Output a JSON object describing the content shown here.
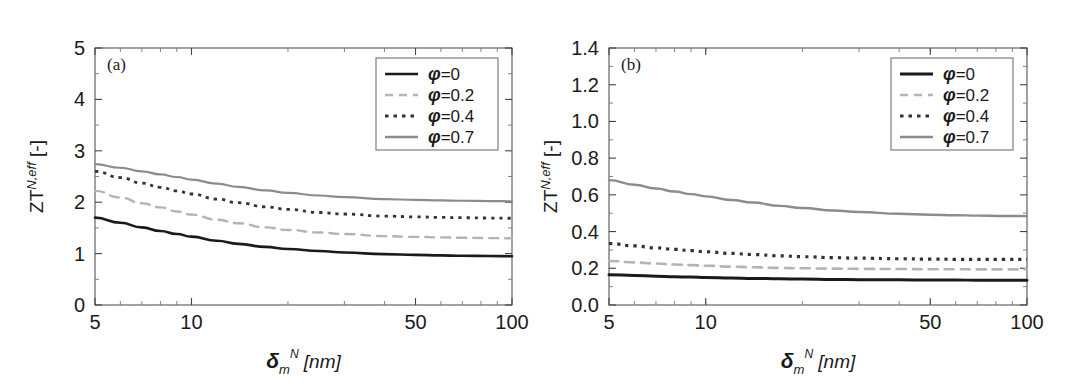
{
  "figure": {
    "background": "#ffffff",
    "panel_count": 2
  },
  "chart_data": [
    {
      "type": "line",
      "panel_tag": "(a)",
      "title": "",
      "xlabel": "δᵐᴺ [nm]",
      "xlabel_parts": {
        "symbol": "δ",
        "sub": "m",
        "sup": "N",
        "unit": "[nm]"
      },
      "ylabel_parts": {
        "base": "ZT",
        "sup": "N,eff",
        "unit": "[-]"
      },
      "ylabel": "ZT^{N,eff} [-]",
      "xscale": "log",
      "xlim": [
        5,
        100
      ],
      "ylim": [
        0,
        5
      ],
      "xticks": [
        5,
        10,
        50,
        100
      ],
      "xtick_labels": [
        "5",
        "10",
        "50",
        "100"
      ],
      "yticks": [
        0,
        1,
        2,
        3,
        4,
        5
      ],
      "ytick_labels": [
        "0",
        "1",
        "2",
        "3",
        "4",
        "5"
      ],
      "grid": false,
      "legend_position": "upper right",
      "series": [
        {
          "name": "φ=0",
          "phi": 0,
          "color": "#1a1a1a",
          "dash": "solid",
          "width": 2.6,
          "x": [
            5,
            6,
            7,
            8,
            9,
            10,
            12,
            14,
            17,
            20,
            25,
            30,
            40,
            50,
            60,
            70,
            85,
            100
          ],
          "y": [
            1.7,
            1.6,
            1.51,
            1.44,
            1.38,
            1.33,
            1.25,
            1.19,
            1.13,
            1.09,
            1.05,
            1.02,
            0.99,
            0.975,
            0.965,
            0.958,
            0.952,
            0.948
          ]
        },
        {
          "name": "φ=0.2",
          "phi": 0.2,
          "color": "#b4b4b4",
          "dash": "dashed",
          "width": 2.4,
          "x": [
            5,
            6,
            7,
            8,
            9,
            10,
            12,
            14,
            17,
            20,
            25,
            30,
            40,
            50,
            60,
            70,
            85,
            100
          ],
          "y": [
            2.22,
            2.09,
            1.98,
            1.9,
            1.82,
            1.76,
            1.66,
            1.59,
            1.51,
            1.46,
            1.41,
            1.38,
            1.34,
            1.325,
            1.315,
            1.308,
            1.302,
            1.298
          ]
        },
        {
          "name": "φ=0.4",
          "phi": 0.4,
          "color": "#333333",
          "dash": "dotted",
          "width": 2.8,
          "x": [
            5,
            6,
            7,
            8,
            9,
            10,
            12,
            14,
            17,
            20,
            25,
            30,
            40,
            50,
            60,
            70,
            85,
            100
          ],
          "y": [
            2.6,
            2.48,
            2.37,
            2.29,
            2.22,
            2.16,
            2.06,
            1.99,
            1.91,
            1.86,
            1.8,
            1.77,
            1.73,
            1.715,
            1.705,
            1.698,
            1.692,
            1.688
          ]
        },
        {
          "name": "φ=0.7",
          "phi": 0.7,
          "color": "#8c8c8c",
          "dash": "solid",
          "width": 2.2,
          "x": [
            5,
            6,
            7,
            8,
            9,
            10,
            12,
            14,
            17,
            20,
            25,
            30,
            40,
            50,
            60,
            70,
            85,
            100
          ],
          "y": [
            2.74,
            2.67,
            2.6,
            2.54,
            2.49,
            2.44,
            2.36,
            2.3,
            2.23,
            2.18,
            2.13,
            2.1,
            2.06,
            2.045,
            2.035,
            2.028,
            2.022,
            2.018
          ]
        }
      ]
    },
    {
      "type": "line",
      "panel_tag": "(b)",
      "title": "",
      "xlabel": "δᵐᴺ [nm]",
      "xlabel_parts": {
        "symbol": "δ",
        "sub": "m",
        "sup": "N",
        "unit": "[nm]"
      },
      "ylabel_parts": {
        "base": "ZT",
        "sup": "N,eff",
        "unit": "[-]"
      },
      "ylabel": "ZT^{N,eff} [-]",
      "xscale": "log",
      "xlim": [
        5,
        100
      ],
      "ylim": [
        0.0,
        1.4
      ],
      "xticks": [
        5,
        10,
        50,
        100
      ],
      "xtick_labels": [
        "5",
        "10",
        "50",
        "100"
      ],
      "yticks": [
        0.0,
        0.2,
        0.4,
        0.6,
        0.8,
        1.0,
        1.2,
        1.4
      ],
      "ytick_labels": [
        "0.0",
        "0.2",
        "0.4",
        "0.6",
        "0.8",
        "1.0",
        "1.2",
        "1.4"
      ],
      "grid": false,
      "legend_position": "upper right",
      "series": [
        {
          "name": "φ=0",
          "phi": 0,
          "color": "#1a1a1a",
          "dash": "solid",
          "width": 3.0,
          "x": [
            5,
            6,
            7,
            8,
            9,
            10,
            12,
            14,
            17,
            20,
            25,
            30,
            40,
            50,
            60,
            70,
            85,
            100
          ],
          "y": [
            0.165,
            0.161,
            0.157,
            0.154,
            0.152,
            0.15,
            0.147,
            0.145,
            0.143,
            0.141,
            0.139,
            0.138,
            0.137,
            0.136,
            0.136,
            0.135,
            0.135,
            0.135
          ]
        },
        {
          "name": "φ=0.2",
          "phi": 0.2,
          "color": "#b4b4b4",
          "dash": "dashed",
          "width": 2.6,
          "x": [
            5,
            6,
            7,
            8,
            9,
            10,
            12,
            14,
            17,
            20,
            25,
            30,
            40,
            50,
            60,
            70,
            85,
            100
          ],
          "y": [
            0.24,
            0.232,
            0.226,
            0.221,
            0.217,
            0.214,
            0.209,
            0.206,
            0.202,
            0.2,
            0.198,
            0.197,
            0.196,
            0.195,
            0.195,
            0.194,
            0.194,
            0.194
          ]
        },
        {
          "name": "φ=0.4",
          "phi": 0.4,
          "color": "#333333",
          "dash": "dotted",
          "width": 3.2,
          "x": [
            5,
            6,
            7,
            8,
            9,
            10,
            12,
            14,
            17,
            20,
            25,
            30,
            40,
            50,
            60,
            70,
            85,
            100
          ],
          "y": [
            0.335,
            0.322,
            0.311,
            0.303,
            0.296,
            0.29,
            0.281,
            0.275,
            0.268,
            0.263,
            0.258,
            0.255,
            0.252,
            0.25,
            0.249,
            0.249,
            0.248,
            0.248
          ]
        },
        {
          "name": "φ=0.7",
          "phi": 0.7,
          "color": "#8c8c8c",
          "dash": "solid",
          "width": 2.4,
          "x": [
            5,
            6,
            7,
            8,
            9,
            10,
            12,
            14,
            17,
            20,
            25,
            30,
            40,
            50,
            60,
            70,
            85,
            100
          ],
          "y": [
            0.68,
            0.655,
            0.635,
            0.618,
            0.604,
            0.592,
            0.572,
            0.558,
            0.54,
            0.528,
            0.515,
            0.507,
            0.497,
            0.492,
            0.489,
            0.487,
            0.485,
            0.484
          ]
        }
      ]
    }
  ]
}
